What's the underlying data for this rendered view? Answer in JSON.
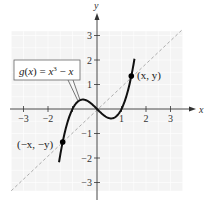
{
  "chart_data": {
    "type": "line",
    "title": "",
    "xlabel": "x",
    "ylabel": "y",
    "xlim": [
      -3.5,
      3.5
    ],
    "ylim": [
      -3.5,
      3.5
    ],
    "grid": true,
    "x_ticks": [
      -3,
      -2,
      -1,
      1,
      2,
      3
    ],
    "y_ticks": [
      -3,
      -2,
      -1,
      1,
      2,
      3
    ],
    "x_tick_labels": [
      "−3",
      "−2",
      "",
      "1",
      "2",
      "3"
    ],
    "y_tick_labels": [
      "−3",
      "−2",
      "−1",
      "1",
      "2",
      "3"
    ],
    "series": [
      {
        "name": "g(x) = x³ − x",
        "style": "solid",
        "color": "#111111",
        "function": "x^3 - x",
        "x": [
          -1.5,
          -1.25,
          -1.0,
          -0.75,
          -0.577,
          -0.25,
          0.0,
          0.25,
          0.577,
          0.75,
          1.0,
          1.25,
          1.5
        ],
        "y": [
          -1.875,
          -0.703,
          0.0,
          0.328,
          0.385,
          0.234,
          0.0,
          -0.234,
          -0.385,
          -0.328,
          0.0,
          0.703,
          1.875
        ]
      },
      {
        "name": "y = x",
        "style": "dashed",
        "color": "#aaaaaa",
        "x": [
          -3.5,
          3.5
        ],
        "y": [
          -3.5,
          3.5
        ]
      }
    ],
    "points": [
      {
        "label": "(x, y)",
        "x": 1.4,
        "y": 1.344
      },
      {
        "label": "(−x, −y)",
        "x": -1.4,
        "y": -1.344
      }
    ],
    "annotations": [
      {
        "text": "g(x) = x³ − x",
        "boxed": true,
        "pointer_to": [
          -0.8,
          0.3
        ]
      }
    ]
  },
  "labels": {
    "x_axis": "x",
    "y_axis": "y",
    "function_box": {
      "g": "g",
      "paren_open": "(",
      "x1": "x",
      "paren_close": ") = ",
      "x2": "x",
      "exp": "3",
      "minus": " − ",
      "x3": "x"
    },
    "point_pos": "(x, y)",
    "point_neg": "(−x, −y)"
  },
  "colors": {
    "grid_bg": "#f4f4f4",
    "grid_line": "#ffffff",
    "axis": "#333333",
    "curve": "#111111",
    "dashed": "#aaaaaa"
  }
}
